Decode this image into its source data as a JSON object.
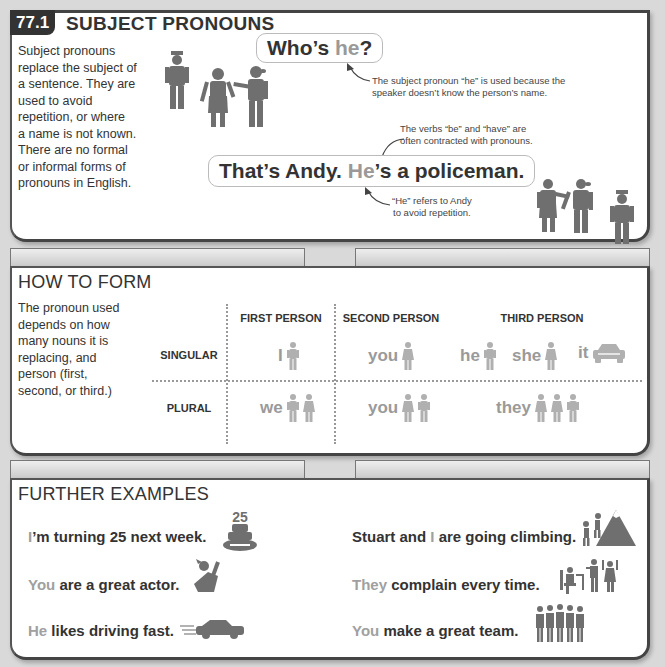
{
  "section1": {
    "number": "77.1",
    "title": "SUBJECT PRONOUNS",
    "intro_lines": [
      "Subject pronouns",
      "replace the subject of",
      "a sentence. They are",
      "used to avoid",
      "repetition, or where",
      "a name is not known.",
      "There are no formal",
      "or informal forms of",
      "pronouns in English."
    ],
    "bubble1": {
      "before": "Who’s ",
      "highlight": "he",
      "after": "?"
    },
    "note1_lines": [
      "The subject pronoun “he” is used because the",
      "speaker doesn’t know the person’s name."
    ],
    "note2_lines": [
      "The verbs “be” and “have” are",
      "often contracted with pronouns."
    ],
    "bubble2": {
      "before": "That’s Andy. ",
      "highlight": "He",
      "after": "’s a policeman."
    },
    "note3_lines": [
      "“He” refers to Andy",
      "to avoid repetition."
    ]
  },
  "section2": {
    "title": "HOW TO FORM",
    "intro_lines": [
      "The pronoun used",
      "depends on how",
      "many nouns it is",
      "replacing, and",
      "person (first,",
      "second, or third.)"
    ],
    "columns": [
      "FIRST PERSON",
      "SECOND PERSON",
      "THIRD PERSON"
    ],
    "rows": [
      "SINGULAR",
      "PLURAL"
    ],
    "singular": {
      "first": "I",
      "second": "you",
      "third": [
        "he",
        "she",
        "it"
      ]
    },
    "plural": {
      "first": "we",
      "second": "you",
      "third": "they"
    }
  },
  "section3": {
    "title": "FURTHER EXAMPLES",
    "examples": [
      {
        "highlight": "I",
        "rest": "’m turning 25 next week.",
        "icon": "birthday-cake-icon"
      },
      {
        "highlight": "You",
        "rest": " are a great actor.",
        "icon": "actor-icon"
      },
      {
        "highlight": "He",
        "rest": " likes driving fast.",
        "icon": "fast-car-icon"
      },
      {
        "before": "Stuart and ",
        "highlight": "I",
        "rest": " are going climbing.",
        "icon": "mountain-climbers-icon"
      },
      {
        "highlight": "They",
        "rest": " complain every time.",
        "icon": "complaining-people-icon"
      },
      {
        "highlight": "You",
        "rest": " make a great team.",
        "icon": "team-icon"
      }
    ],
    "cake_number": "25"
  },
  "colors": {
    "text": "#333333",
    "highlight": "#999999",
    "figure": "#707070",
    "figure_light": "#b0b0b0",
    "background": "#d9d9d9"
  }
}
